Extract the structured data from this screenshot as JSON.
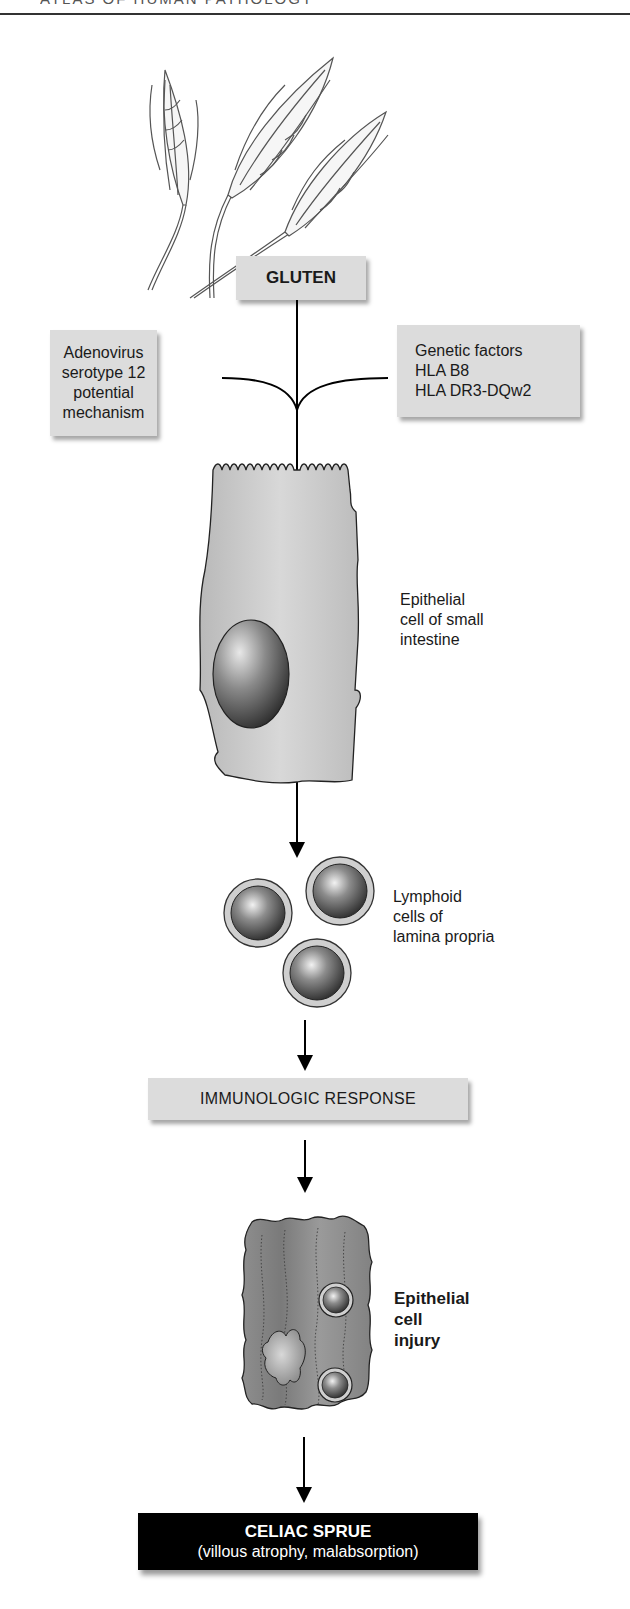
{
  "header": {
    "running_title": "ATLAS OF HUMAN PATHOLOGY"
  },
  "diagram": {
    "title_node": "GLUTEN",
    "left_factor": {
      "lines": [
        "Adenovirus",
        "serotype 12",
        "potential",
        "mechanism"
      ]
    },
    "right_factor": {
      "lines": [
        "Genetic factors",
        "HLA B8",
        "HLA DR3-DQw2"
      ]
    },
    "epithelial_cell_label": {
      "lines": [
        "Epithelial",
        "cell of small",
        "intestine"
      ]
    },
    "lymphoid_label": {
      "lines": [
        "Lymphoid",
        "cells of",
        "lamina propria"
      ]
    },
    "immunologic_node": "IMMUNOLOGIC RESPONSE",
    "injury_label": {
      "lines": [
        "Epithelial",
        "cell",
        "injury"
      ]
    },
    "final_node": {
      "title": "CELIAC SPRUE",
      "subtitle": "(villous atrophy, malabsorption)"
    },
    "colors": {
      "box_fill": "#dcdcdc",
      "final_fill": "#000000",
      "cell_fill": "#c8c8c8",
      "injured_cell_fill": "#8c8c8c",
      "nucleus_dark": "#3a3a3a"
    }
  }
}
